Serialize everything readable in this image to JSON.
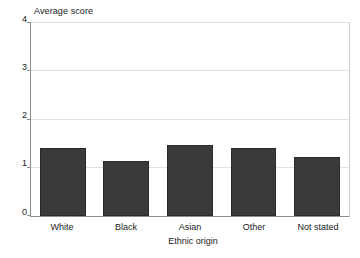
{
  "chart_data": {
    "type": "bar",
    "title": "",
    "categories": [
      "White",
      "Black",
      "Asian",
      "Other",
      "Not stated"
    ],
    "values": [
      1.4,
      1.15,
      1.48,
      1.4,
      1.23
    ],
    "series": [
      {
        "name": "Average score",
        "values": [
          1.4,
          1.15,
          1.48,
          1.4,
          1.23
        ]
      }
    ],
    "xlabel": "Ethnic origin",
    "ylabel": "Average score",
    "ylim": [
      0,
      4
    ],
    "yticks": [
      "0",
      "1",
      "2",
      "3",
      "4"
    ],
    "ytick_values": [
      0,
      1,
      2,
      3,
      4
    ],
    "grid": true,
    "legend": false,
    "bar_color": "#3a3a3a",
    "grid_color": "#e2e2e2",
    "axis_color": "#8d8d8d"
  },
  "axes": {
    "y_title": "Average score",
    "x_title": "Ethnic origin"
  }
}
